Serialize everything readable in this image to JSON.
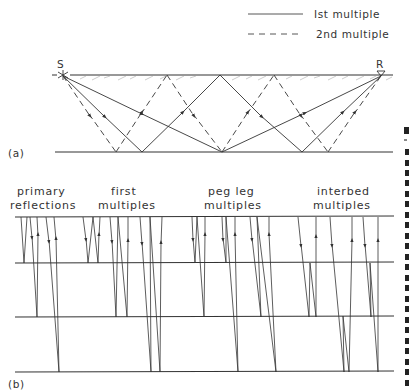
{
  "legend": {
    "items": [
      {
        "label": "Ist multiple",
        "style": "solid"
      },
      {
        "label": "2nd multiple",
        "style": "dashed"
      }
    ]
  },
  "panel_a": {
    "label": "(a)",
    "source_label": "S",
    "receiver_label": "R"
  },
  "panel_b": {
    "label": "(b)",
    "groups": [
      {
        "line1": "primary",
        "line2": "reflections"
      },
      {
        "line1": "first",
        "line2": "multiples"
      },
      {
        "line1": "peg leg",
        "line2": "multiples"
      },
      {
        "line1": "interbed",
        "line2": "multiples"
      }
    ]
  },
  "colors": {
    "ink": "#333333",
    "background": "#ffffff"
  }
}
